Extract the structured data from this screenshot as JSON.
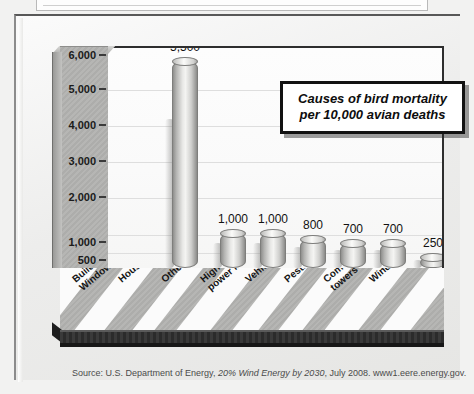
{
  "figure": {
    "title_line1": "Causes of bird mortality",
    "title_line2": "per 10,000 avian deaths",
    "source_prefix": "Source: U.S. Department of Energy, ",
    "source_italic": "20% Wind Energy by 2030",
    "source_suffix": ", July 2008. www1.eere.energy.gov."
  },
  "chart_data": {
    "type": "bar",
    "title": "Causes of bird mortality per 10,000 avian deaths",
    "xlabel": "",
    "ylabel": "",
    "grid": true,
    "legend": "none",
    "orientation": "vertical-3d-cylinder",
    "ylim": [
      0,
      6000
    ],
    "yticks": [
      0,
      500,
      1000,
      2000,
      3000,
      4000,
      5000,
      6000
    ],
    "ytick_labels": [
      "0",
      "500",
      "1,000",
      "2,000",
      "3,000",
      "4,000",
      "5,000",
      "6,000"
    ],
    "note": "Y axis scale is broken between 0 and 1,000 — a 500 tick is drawn at half spacing.",
    "categories": [
      "Buildings/ Windows",
      "House cats",
      "Other",
      "High-tension power lines",
      "Vehicles",
      "Pesticides",
      "Communication towers",
      "Wind turbines"
    ],
    "category_lines": [
      [
        "Buildings/",
        "Windows"
      ],
      [
        "House cats"
      ],
      [
        "Other"
      ],
      [
        "High-tension",
        "power lines"
      ],
      [
        "Vehicles"
      ],
      [
        "Pesticides"
      ],
      [
        "Communication",
        "towers"
      ],
      [
        "Wind turbines"
      ]
    ],
    "values": [
      5500,
      1000,
      1000,
      800,
      700,
      700,
      250,
      0.75
    ],
    "value_labels": [
      "5,500",
      "1,000",
      "1,000",
      "800",
      "700",
      "700",
      "250",
      "0.75"
    ]
  },
  "bars": [
    {
      "label": "5,500",
      "left": 64,
      "height": 207,
      "cat_x": 10,
      "cat_y": 8
    },
    {
      "label": "1,000",
      "left": 112,
      "height": 35,
      "cat_x": 56,
      "cat_y": 8
    },
    {
      "label": "1,000",
      "left": 152,
      "height": 35,
      "cat_x": 99,
      "cat_y": 8
    },
    {
      "label": "800",
      "left": 192,
      "height": 29,
      "cat_x": 138,
      "cat_y": 8
    },
    {
      "label": "700",
      "left": 232,
      "height": 25,
      "cat_x": 183,
      "cat_y": 8
    },
    {
      "label": "700",
      "left": 272,
      "height": 25,
      "cat_x": 222,
      "cat_y": 8
    },
    {
      "label": "250",
      "left": 312,
      "height": 11,
      "cat_x": 261,
      "cat_y": 8
    },
    {
      "label": "0.75",
      "left": 352,
      "height": 2,
      "cat_x": 307,
      "cat_y": 8
    }
  ],
  "yaxis": [
    {
      "label": "6,000",
      "top": 8
    },
    {
      "label": "5,000",
      "top": 42
    },
    {
      "label": "4,000",
      "top": 78
    },
    {
      "label": "3,000",
      "top": 114
    },
    {
      "label": "2,000",
      "top": 150
    },
    {
      "label": "1,000",
      "top": 195
    },
    {
      "label": "500",
      "top": 213
    },
    {
      "label": "0",
      "top": 230
    }
  ],
  "gridlines": [
    42,
    78,
    114,
    150,
    187,
    205
  ],
  "stripes": [
    {
      "left": -26,
      "width": 38
    },
    {
      "left": 38,
      "width": 30
    },
    {
      "left": 96,
      "width": 22
    },
    {
      "left": 140,
      "width": 34
    },
    {
      "left": 196,
      "width": 26
    },
    {
      "left": 242,
      "width": 24
    },
    {
      "left": 288,
      "width": 34
    },
    {
      "left": 344,
      "width": 30
    }
  ]
}
